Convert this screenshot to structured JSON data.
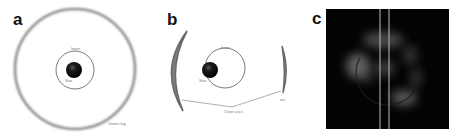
{
  "figure": {
    "panels": [
      {
        "letter": "a",
        "labels": {
          "orbit": "Inner",
          "star": "Star",
          "ring": "Outer ring"
        }
      },
      {
        "letter": "b",
        "labels": {
          "orbit": "Inner",
          "star": "Star",
          "arcs": "Outer arcs",
          "right_arc": "arc"
        }
      },
      {
        "letter": "c"
      }
    ],
    "colors": {
      "ring": "#8a8a8a",
      "orbit": "#555555",
      "star": "#111111",
      "image_bg": "#030303",
      "image_line": "#bdbdbd"
    }
  }
}
